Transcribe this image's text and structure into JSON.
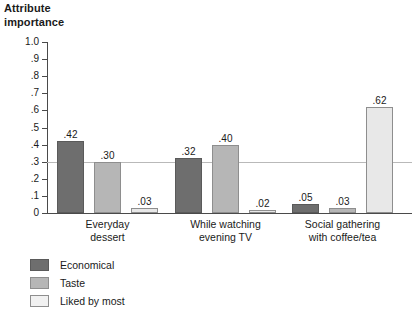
{
  "chart_data": {
    "type": "bar",
    "title": "Attribute\nimportance",
    "xlabel": "",
    "ylabel": "Attribute importance",
    "ylim": [
      0,
      1.0
    ],
    "grid": false,
    "reference_line": 0.3,
    "legend_position": "bottom-left",
    "categories": [
      "Everyday\ndessert",
      "While watching\nevening TV",
      "Social gathering\nwith coffee/tea"
    ],
    "series": [
      {
        "name": "Economical",
        "values": [
          0.42,
          0.32,
          0.05
        ],
        "labels": [
          ".42",
          ".32",
          ".05"
        ],
        "color": "#6e6e6e"
      },
      {
        "name": "Taste",
        "values": [
          0.3,
          0.4,
          0.03
        ],
        "labels": [
          ".30",
          ".40",
          ".03"
        ],
        "color": "#b6b6b6"
      },
      {
        "name": "Liked by most",
        "values": [
          0.03,
          0.02,
          0.62
        ],
        "labels": [
          ".03",
          ".02",
          ".62"
        ],
        "color": "#e8e8e8"
      }
    ],
    "yticks": [
      {
        "value": 1.0,
        "label": "1.0"
      },
      {
        "value": 0.9,
        "label": ".9"
      },
      {
        "value": 0.8,
        "label": ".8"
      },
      {
        "value": 0.7,
        "label": ".7"
      },
      {
        "value": 0.6,
        "label": ".6"
      },
      {
        "value": 0.5,
        "label": ".5"
      },
      {
        "value": 0.4,
        "label": ".4"
      },
      {
        "value": 0.3,
        "label": ".3"
      },
      {
        "value": 0.2,
        "label": ".2"
      },
      {
        "value": 0.1,
        "label": ".1"
      },
      {
        "value": 0.0,
        "label": "0"
      }
    ]
  },
  "layout": {
    "plot_left": 47,
    "plot_top": 42,
    "plot_width": 365,
    "plot_height": 171,
    "group_starts": [
      10,
      128,
      245
    ],
    "bar_width": 27,
    "bar_gap": 10
  }
}
